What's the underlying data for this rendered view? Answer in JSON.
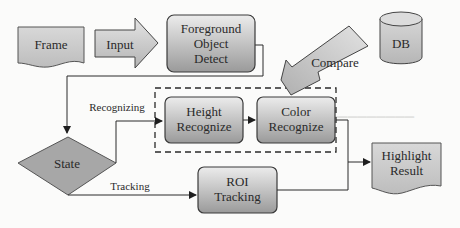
{
  "diagram": {
    "nodes": {
      "frame": {
        "label": "Frame",
        "shape": "document"
      },
      "input": {
        "label": "Input",
        "shape": "block-arrow-right"
      },
      "foreground": {
        "line1": "Foreground",
        "line2": "Object",
        "line3": "Detect",
        "shape": "rounded-rect"
      },
      "db": {
        "label": "DB",
        "shape": "cylinder"
      },
      "compare": {
        "label": "Compare",
        "shape": "block-arrow-down-left"
      },
      "state": {
        "label": "State",
        "shape": "diamond"
      },
      "height": {
        "line1": "Height",
        "line2": "Recognize",
        "shape": "rounded-rect"
      },
      "color": {
        "line1": "Color",
        "line2": "Recognize",
        "shape": "rounded-rect"
      },
      "roi": {
        "line1": "ROI",
        "line2": "Tracking",
        "shape": "rounded-rect"
      },
      "highlight": {
        "line1": "Highlight",
        "line2": "Result",
        "shape": "document"
      }
    },
    "edges": {
      "recognizing": {
        "label": "Recognizing"
      },
      "tracking": {
        "label": "Tracking"
      }
    },
    "colors": {
      "shape_fill_light": "#e6e6e6",
      "shape_fill_dark": "#9c9c9c",
      "stroke": "#3a3a3a",
      "line": "#2b2b2b",
      "background": "#fbfbfa"
    }
  }
}
